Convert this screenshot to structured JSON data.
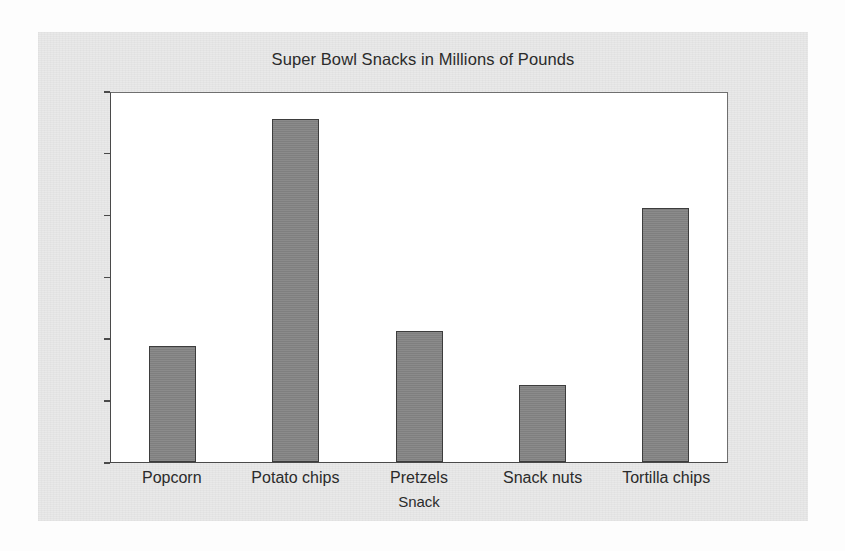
{
  "chart_data": {
    "type": "bar",
    "title": "Super Bowl Snacks in Millions of Pounds",
    "xlabel": "Snack",
    "ylabel": "Pounds in Millions",
    "categories": [
      "Popcorn",
      "Potato chips",
      "Pretzels",
      "Snack nuts",
      "Tortilla chips"
    ],
    "values": [
      3.75,
      11.1,
      4.25,
      2.5,
      8.2
    ],
    "ylim": [
      0,
      12
    ],
    "yticks": [
      0,
      2,
      4,
      6,
      8,
      10,
      12
    ],
    "ytick_labels": [
      "0",
      "2",
      "4",
      "6",
      "8",
      "10",
      "12"
    ],
    "grid": false,
    "legend": null,
    "bar_color": "#848484",
    "bar_edge_color": "#3d3d3d",
    "plot_background": "#ffffff",
    "figure_background": "#e9e9e9",
    "text_color": "#2b2b2b",
    "axis_color": "#4a4a4a"
  }
}
